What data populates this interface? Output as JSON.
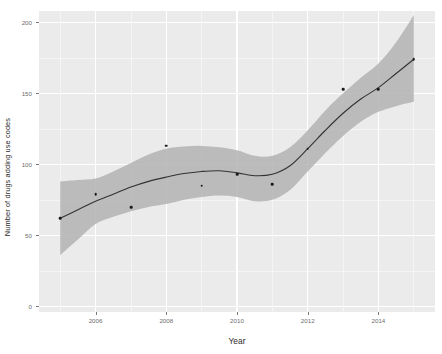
{
  "chart_data": {
    "type": "scatter",
    "title": "",
    "subtitle": "",
    "xlabel": "Year",
    "ylabel": "Number of drugs adding use codes",
    "x": [
      2005,
      2006,
      2007,
      2008,
      2009,
      2010,
      2011,
      2012,
      2013,
      2014,
      2015
    ],
    "values": [
      62,
      79,
      70,
      113,
      85,
      93,
      86,
      111,
      153,
      153,
      174
    ],
    "series": [
      {
        "name": "Number of drugs adding use codes",
        "type": "scatter",
        "values": [
          62,
          79,
          70,
          113,
          85,
          93,
          86,
          111,
          153,
          153,
          174
        ]
      },
      {
        "name": "LOESS smooth",
        "type": "line",
        "x": [
          2005,
          2005.5,
          2006,
          2006.5,
          2007,
          2007.5,
          2008,
          2008.5,
          2009,
          2009.5,
          2010,
          2010.5,
          2011,
          2011.5,
          2012,
          2012.5,
          2013,
          2013.5,
          2014,
          2014.5,
          2015
        ],
        "values": [
          62,
          68,
          74,
          79,
          84,
          88,
          91,
          93.5,
          95,
          95.5,
          94,
          92,
          93,
          99,
          111,
          124,
          136,
          146,
          154,
          164,
          174
        ]
      },
      {
        "name": "95% confidence band upper",
        "type": "line",
        "x": [
          2005,
          2005.5,
          2006,
          2006.5,
          2007,
          2007.5,
          2008,
          2008.5,
          2009,
          2009.5,
          2010,
          2010.5,
          2011,
          2011.5,
          2012,
          2012.5,
          2013,
          2013.5,
          2014,
          2014.5,
          2015
        ],
        "values": [
          88,
          89,
          90,
          95,
          101,
          107,
          111,
          112.5,
          113,
          112,
          110,
          106,
          106,
          112,
          124,
          138,
          150,
          161,
          171,
          186,
          205
        ]
      },
      {
        "name": "95% confidence band lower",
        "type": "line",
        "x": [
          2005,
          2005.5,
          2006,
          2006.5,
          2007,
          2007.5,
          2008,
          2008.5,
          2009,
          2009.5,
          2010,
          2010.5,
          2011,
          2011.5,
          2012,
          2012.5,
          2013,
          2013.5,
          2014,
          2014.5,
          2015
        ],
        "values": [
          36,
          47,
          58,
          63,
          67,
          70,
          72,
          75,
          77,
          78,
          77,
          74,
          75,
          82,
          95,
          108,
          120,
          130,
          137,
          141,
          144
        ]
      }
    ],
    "xlim": [
      2004.4,
      2015.6
    ],
    "ylim": [
      -4,
      208
    ],
    "x_ticks": [
      2006,
      2008,
      2010,
      2012,
      2014
    ],
    "x_tick_labels": [
      "2006",
      "2008",
      "2010",
      "2012",
      "2014"
    ],
    "y_ticks": [
      0,
      50,
      100,
      150,
      200
    ],
    "y_tick_labels": [
      "0",
      "50",
      "100",
      "150",
      "200"
    ],
    "grid": true,
    "legend": "none",
    "colors": {
      "panel_background": "#ebebeb",
      "gridline_major": "#ffffff",
      "gridline_minor": "#f5f5f5",
      "point": "#1a1a1a",
      "smooth_line": "#333333",
      "confidence_band": "#b3b3b3",
      "axis_text": "#6e6e6e",
      "axis_title": "#2b2b2b",
      "plot_background": "#ffffff"
    }
  }
}
